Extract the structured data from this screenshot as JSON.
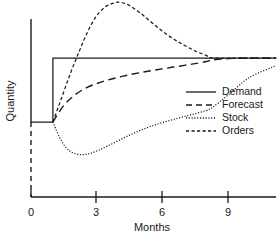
{
  "chart_data": {
    "type": "line",
    "title": "",
    "xlabel": "Months",
    "ylabel": "Quantity",
    "xlim": [
      -0.4,
      11.2
    ],
    "ylim": [
      -1.35,
      1.95
    ],
    "grid": false,
    "legend_position": "right-middle",
    "xticks": [
      0,
      3,
      6,
      9
    ],
    "xticklabels": [
      "0",
      "3",
      "6",
      "9"
    ],
    "yticks": [],
    "yticklabels": [],
    "annotations": [
      "Step increase in demand occurs at month 1",
      "Orders overshoot demand, peaking near month 4",
      "Stock undershoots, troughing near month 2.3",
      "All series converge to the new demand level near month 8.3"
    ],
    "series": [
      {
        "name": "Demand",
        "style": "solid",
        "x": [
          0.0,
          1.0,
          1.0,
          11.2
        ],
        "values": [
          0.0,
          0.0,
          1.0,
          1.0
        ]
      },
      {
        "name": "Forecast",
        "style": "dashed-long",
        "x": [
          1.0,
          1.5,
          2.0,
          2.5,
          3.0,
          3.5,
          4.0,
          4.5,
          5.0,
          5.5,
          6.0,
          6.5,
          7.0,
          7.5,
          8.0,
          8.3,
          9.0,
          10.0,
          11.2
        ],
        "values": [
          0.0,
          0.26,
          0.42,
          0.53,
          0.6,
          0.655,
          0.7,
          0.738,
          0.772,
          0.802,
          0.83,
          0.858,
          0.885,
          0.912,
          0.945,
          0.97,
          0.99,
          1.0,
          1.0
        ]
      },
      {
        "name": "Stock",
        "style": "dotted",
        "x": [
          1.0,
          1.3,
          1.6,
          1.9,
          2.3,
          2.7,
          3.1,
          3.5,
          4.0,
          4.5,
          5.0,
          5.5,
          6.0,
          6.5,
          7.0,
          7.5,
          8.0,
          8.3,
          9.0,
          10.0,
          11.2
        ],
        "values": [
          0.0,
          -0.24,
          -0.4,
          -0.48,
          -0.51,
          -0.49,
          -0.44,
          -0.375,
          -0.29,
          -0.205,
          -0.13,
          -0.065,
          -0.01,
          0.04,
          0.085,
          0.13,
          0.18,
          0.23,
          0.42,
          0.7,
          0.88
        ]
      },
      {
        "name": "Orders",
        "style": "dashed-short",
        "x": [
          1.0,
          1.4,
          1.8,
          2.2,
          2.6,
          3.0,
          3.4,
          3.8,
          4.1,
          4.5,
          5.0,
          5.5,
          6.0,
          6.5,
          7.0,
          7.5,
          8.0,
          8.3,
          9.0,
          10.0,
          11.2
        ],
        "values": [
          0.0,
          0.38,
          0.76,
          1.1,
          1.42,
          1.66,
          1.8,
          1.86,
          1.87,
          1.82,
          1.7,
          1.56,
          1.42,
          1.3,
          1.2,
          1.11,
          1.04,
          1.0,
          1.0,
          1.0,
          1.0
        ]
      }
    ],
    "legend": [
      {
        "label": "Demand",
        "style": "solid"
      },
      {
        "label": "Forecast",
        "style": "dashed-long"
      },
      {
        "label": "Stock",
        "style": "dotted"
      },
      {
        "label": "Orders",
        "style": "dashed-short"
      }
    ]
  }
}
